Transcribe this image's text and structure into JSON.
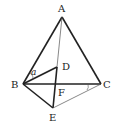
{
  "figure": {
    "points": {
      "A": {
        "label": "A",
        "x": 62,
        "y": 17
      },
      "B": {
        "label": "B",
        "x": 23,
        "y": 84
      },
      "C": {
        "label": "C",
        "x": 101,
        "y": 84
      },
      "D": {
        "label": "D",
        "x": 57,
        "y": 67
      },
      "E": {
        "label": "E",
        "x": 53,
        "y": 108
      },
      "F": {
        "label": "F",
        "x": 56,
        "y": 84
      }
    },
    "angle_label": "a",
    "colors": {
      "stroke": "#222222",
      "thin_stroke": "#555555"
    }
  }
}
